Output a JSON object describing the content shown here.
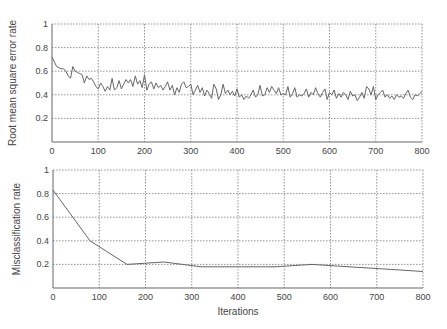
{
  "chart_data": [
    {
      "type": "line",
      "title": "",
      "xlabel": "",
      "ylabel": "Root mean square error rate",
      "xlim": [
        0,
        800
      ],
      "ylim": [
        0,
        1
      ],
      "grid": true,
      "x_ticks": [
        "0",
        "100",
        "200",
        "300",
        "400",
        "500",
        "600",
        "700",
        "800"
      ],
      "y_ticks": [
        "0.2",
        "0.4",
        "0.6",
        "0.8",
        "1"
      ],
      "series": [
        {
          "name": "RMSE",
          "x": [
            0,
            5,
            10,
            15,
            20,
            25,
            30,
            35,
            40,
            45,
            50,
            55,
            60,
            65,
            70,
            75,
            80,
            85,
            90,
            95,
            100,
            105,
            110,
            115,
            120,
            125,
            130,
            135,
            140,
            145,
            150,
            155,
            160,
            165,
            170,
            175,
            180,
            185,
            190,
            195,
            200,
            205,
            210,
            215,
            220,
            225,
            230,
            235,
            240,
            245,
            250,
            255,
            260,
            265,
            270,
            275,
            280,
            285,
            290,
            295,
            300,
            305,
            310,
            315,
            320,
            325,
            330,
            335,
            340,
            345,
            350,
            355,
            360,
            365,
            370,
            375,
            380,
            385,
            390,
            395,
            400,
            405,
            410,
            415,
            420,
            425,
            430,
            435,
            440,
            445,
            450,
            455,
            460,
            465,
            470,
            475,
            480,
            485,
            490,
            495,
            500,
            505,
            510,
            515,
            520,
            525,
            530,
            535,
            540,
            545,
            550,
            555,
            560,
            565,
            570,
            575,
            580,
            585,
            590,
            595,
            600,
            605,
            610,
            615,
            620,
            625,
            630,
            635,
            640,
            645,
            650,
            655,
            660,
            665,
            670,
            675,
            680,
            685,
            690,
            695,
            700,
            705,
            710,
            715,
            720,
            725,
            730,
            735,
            740,
            745,
            750,
            755,
            760,
            765,
            770,
            775,
            780,
            785,
            790,
            795,
            800
          ],
          "values": [
            0.72,
            0.68,
            0.64,
            0.63,
            0.62,
            0.62,
            0.6,
            0.56,
            0.54,
            0.64,
            0.6,
            0.59,
            0.58,
            0.57,
            0.5,
            0.56,
            0.53,
            0.54,
            0.51,
            0.47,
            0.45,
            0.5,
            0.47,
            0.43,
            0.47,
            0.44,
            0.54,
            0.44,
            0.46,
            0.52,
            0.45,
            0.49,
            0.53,
            0.5,
            0.53,
            0.47,
            0.56,
            0.49,
            0.52,
            0.46,
            0.57,
            0.44,
            0.49,
            0.51,
            0.45,
            0.5,
            0.46,
            0.48,
            0.44,
            0.47,
            0.51,
            0.44,
            0.48,
            0.4,
            0.46,
            0.42,
            0.49,
            0.51,
            0.46,
            0.47,
            0.49,
            0.4,
            0.44,
            0.48,
            0.42,
            0.46,
            0.39,
            0.44,
            0.41,
            0.37,
            0.49,
            0.45,
            0.36,
            0.4,
            0.49,
            0.41,
            0.44,
            0.4,
            0.43,
            0.39,
            0.45,
            0.38,
            0.4,
            0.36,
            0.39,
            0.37,
            0.4,
            0.44,
            0.38,
            0.4,
            0.48,
            0.39,
            0.4,
            0.46,
            0.42,
            0.47,
            0.44,
            0.41,
            0.46,
            0.4,
            0.41,
            0.4,
            0.47,
            0.38,
            0.41,
            0.46,
            0.38,
            0.4,
            0.39,
            0.41,
            0.45,
            0.38,
            0.42,
            0.4,
            0.46,
            0.41,
            0.38,
            0.42,
            0.45,
            0.36,
            0.42,
            0.4,
            0.44,
            0.37,
            0.41,
            0.38,
            0.42,
            0.4,
            0.36,
            0.43,
            0.39,
            0.4,
            0.35,
            0.38,
            0.42,
            0.37,
            0.47,
            0.45,
            0.4,
            0.47,
            0.36,
            0.4,
            0.42,
            0.44,
            0.38,
            0.4,
            0.37,
            0.39,
            0.36,
            0.4,
            0.38,
            0.39,
            0.37,
            0.41,
            0.44,
            0.38,
            0.36,
            0.4,
            0.39,
            0.41,
            0.43
          ]
        }
      ]
    },
    {
      "type": "line",
      "title": "",
      "xlabel": "Iterations",
      "ylabel": "Misclassification rate",
      "xlim": [
        0,
        800
      ],
      "ylim": [
        0,
        1
      ],
      "grid": true,
      "x_ticks": [
        "0",
        "100",
        "200",
        "300",
        "400",
        "500",
        "600",
        "700",
        "800"
      ],
      "y_ticks": [
        "0.2",
        "0.4",
        "0.6",
        "0.8",
        "1"
      ],
      "series": [
        {
          "name": "Misclassification",
          "x": [
            0,
            80,
            160,
            240,
            320,
            400,
            480,
            560,
            640,
            720,
            800
          ],
          "values": [
            0.83,
            0.4,
            0.2,
            0.22,
            0.18,
            0.18,
            0.18,
            0.2,
            0.18,
            0.16,
            0.14
          ]
        }
      ]
    }
  ]
}
